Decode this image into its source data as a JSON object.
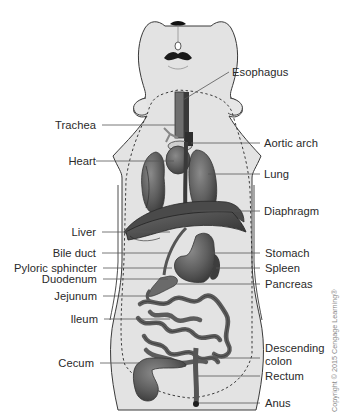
{
  "diagram": {
    "colors": {
      "body_fill": "#e3e3e3",
      "body_stroke": "#3a3a3a",
      "organ_fill": "#5a5a5a",
      "organ_dark": "#3e3e3e",
      "leader_line": "#555555",
      "label_text": "#2a2a2a"
    },
    "labels_left": [
      {
        "id": "trachea",
        "text": "Trachea"
      },
      {
        "id": "heart",
        "text": "Heart"
      },
      {
        "id": "liver",
        "text": "Liver"
      },
      {
        "id": "bile-duct",
        "text": "Bile duct"
      },
      {
        "id": "pyloric-sphincter",
        "text": "Pyloric sphincter"
      },
      {
        "id": "duodenum",
        "text": "Duodenum"
      },
      {
        "id": "jejunum",
        "text": "Jejunum"
      },
      {
        "id": "ileum",
        "text": "Ileum"
      },
      {
        "id": "cecum",
        "text": "Cecum"
      }
    ],
    "labels_right": [
      {
        "id": "esophagus",
        "text": "Esophagus"
      },
      {
        "id": "aortic-arch",
        "text": "Aortic arch"
      },
      {
        "id": "lung",
        "text": "Lung"
      },
      {
        "id": "diaphragm",
        "text": "Diaphragm"
      },
      {
        "id": "stomach",
        "text": "Stomach"
      },
      {
        "id": "spleen",
        "text": "Spleen"
      },
      {
        "id": "pancreas",
        "text": "Pancreas"
      },
      {
        "id": "descending-colon-1",
        "text": "Descending"
      },
      {
        "id": "descending-colon-2",
        "text": "colon"
      },
      {
        "id": "rectum",
        "text": "Rectum"
      },
      {
        "id": "anus",
        "text": "Anus"
      }
    ],
    "copyright": "Copyright © 2015 Cengage Learning®"
  }
}
